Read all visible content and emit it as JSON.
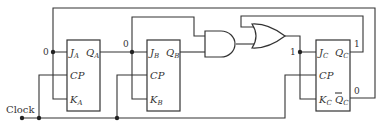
{
  "diagram": {
    "type": "synchronous sequential circuit (JK flip-flops)",
    "clock_label": "Clock",
    "flip_flops": [
      {
        "id": "A",
        "inputs": {
          "J": "J",
          "K": "K",
          "clk": "CP"
        },
        "outputs": {
          "Q": "Q"
        },
        "subscript": "A",
        "j_value": "0",
        "q_value": "0"
      },
      {
        "id": "B",
        "inputs": {
          "J": "J",
          "K": "K",
          "clk": "CP"
        },
        "outputs": {
          "Q": "Q"
        },
        "subscript": "B",
        "j_value": "0"
      },
      {
        "id": "C",
        "inputs": {
          "J": "J",
          "K": "K",
          "clk": "CP"
        },
        "outputs": {
          "Q": "Q",
          "Qbar": "Q"
        },
        "subscript": "C",
        "j_value": "1",
        "q_value": "1",
        "qbar_value": "0"
      }
    ],
    "gates": [
      {
        "type": "AND",
        "inputs": [
          "Q_A",
          "Q_B"
        ]
      },
      {
        "type": "OR",
        "inputs": [
          "Q_C",
          "AND output"
        ]
      }
    ]
  }
}
